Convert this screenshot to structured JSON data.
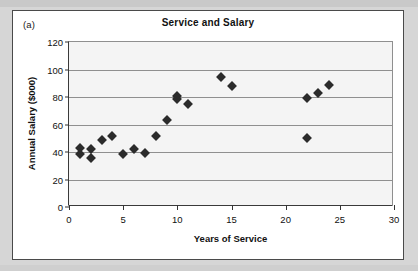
{
  "figure": {
    "panel_label": "(a)",
    "border_color": "#4a4a4a",
    "background": "#ffffff",
    "page_background": "#d6d6d6"
  },
  "chart_data": {
    "type": "scatter",
    "title": "Service and Salary",
    "xlabel": "Years of Service",
    "ylabel": "Annual Salary ($000)",
    "xlim": [
      0,
      30
    ],
    "ylim": [
      0,
      120
    ],
    "xticks": [
      0,
      5,
      10,
      15,
      20,
      25,
      30
    ],
    "yticks": [
      0,
      20,
      40,
      60,
      80,
      100,
      120
    ],
    "grid": "horizontal",
    "legend": "none",
    "marker": "diamond",
    "marker_color": "#2b2b2b",
    "plot_background": "#f4f4f4",
    "series": [
      {
        "name": "Employees",
        "points": [
          [
            1,
            43
          ],
          [
            1,
            38.5
          ],
          [
            2,
            42
          ],
          [
            2,
            35.5
          ],
          [
            3,
            48.5
          ],
          [
            4,
            51.5
          ],
          [
            5,
            38.5
          ],
          [
            6,
            42
          ],
          [
            7,
            39
          ],
          [
            8,
            51.5
          ],
          [
            9,
            63.5
          ],
          [
            10,
            81
          ],
          [
            10,
            78.5
          ],
          [
            11,
            75
          ],
          [
            14,
            94.5
          ],
          [
            15,
            88
          ],
          [
            22,
            79.5
          ],
          [
            22,
            50
          ],
          [
            23,
            83
          ],
          [
            24,
            89
          ]
        ]
      }
    ]
  }
}
